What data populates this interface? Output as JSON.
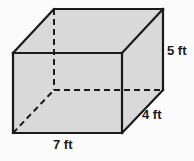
{
  "figure": {
    "name": "rectangular-prism",
    "shape_type": "rectangular prism",
    "background_color": "#fbfbfb",
    "face_fill_color": "#d9d9d9",
    "edge_color": "#1a1a1a",
    "hidden_edge_color": "#1a1a1a",
    "edge_width": 2,
    "hidden_edge_width": 2,
    "hidden_edge_dash": "6,4"
  },
  "labels": {
    "height": "5 ft",
    "depth": "4 ft",
    "width": "7 ft"
  },
  "dimensions": {
    "height_value": 5,
    "depth_value": 4,
    "width_value": 7,
    "unit": "ft"
  },
  "vertices": {
    "front_top_left": [
      13,
      53
    ],
    "front_top_right": [
      122,
      53
    ],
    "front_bottom_right": [
      122,
      133
    ],
    "front_bottom_left": [
      13,
      133
    ],
    "back_top_left": [
      54,
      9
    ],
    "back_top_right": [
      163,
      9
    ],
    "back_bottom_right": [
      163,
      90
    ],
    "back_bottom_left": [
      54,
      90
    ]
  }
}
